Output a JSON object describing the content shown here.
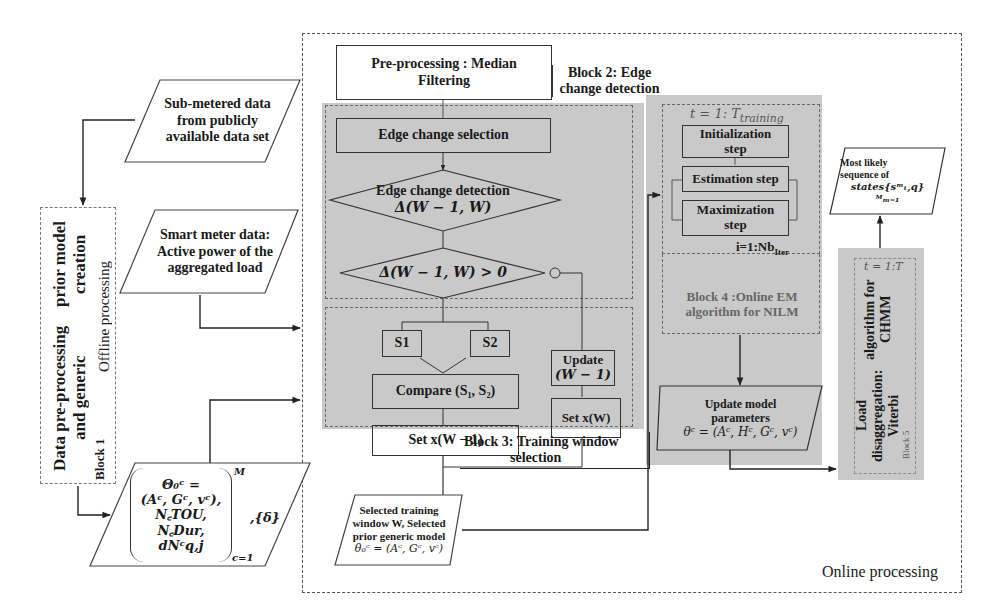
{
  "diagram": {
    "online_label": "Online processing",
    "offline_label": "Offline processing",
    "block1": {
      "title_line1": "Data pre-processing and generic",
      "title_line2": "prior model creation",
      "block_label": "Block 1"
    },
    "inputs": {
      "sub_metered": [
        "Sub-metered data",
        "from publicly",
        "available data set"
      ],
      "smart_meter": [
        "Smart meter data:",
        "Active power of the",
        "aggregated load"
      ]
    },
    "prior_model": {
      "lines": [
        "Θ₀ᶜ =",
        "(Aᶜ, Gᶜ, vᶜ),",
        "N꜀TOU, N꜀Dur,",
        "dNᶜq,j"
      ],
      "superscript": "M",
      "subscript": "c=1",
      "delta": ",{δ}"
    },
    "preprocessing": [
      "Pre-processing : Median",
      "Filtering"
    ],
    "block2": {
      "title": [
        "Block 2: Edge",
        "change detection"
      ],
      "edge_selection": "Edge change selection",
      "edge_detection": [
        "Edge change detection",
        "Δ(W − 1, W)"
      ],
      "condition": "Δ(W − 1, W) > 0"
    },
    "block3": {
      "title": [
        "Block 3: Training window",
        "selection"
      ],
      "s1": "S1",
      "s2": "S2",
      "compare": "Compare (S₁, S₂)",
      "set_prev": "Set x(W − 1)",
      "update": [
        "Update",
        "(W − 1)"
      ],
      "set_curr": "Set x(W)",
      "output": [
        "Selected training",
        "window W, Selected",
        "prior generic model",
        "θ₀ᶜ = (Aᶜ, Gᶜ, vᶜ)"
      ]
    },
    "block4": {
      "loop_label": "t = 1: T",
      "loop_sub": "training",
      "init": [
        "Initialization",
        "step"
      ],
      "estimation": "Estimation step",
      "maximization": [
        "Maximization",
        "step"
      ],
      "iter_label": "i=1:Nb",
      "iter_sub": "Iter",
      "title": [
        "Block 4 :Online EM",
        "algorithm for NILM"
      ],
      "update": [
        "Update model",
        "parameters",
        "θᶜ = (Aᶜ, Hᶜ, Gᶜ, vᶜ)"
      ]
    },
    "block5": {
      "loop_label": "t = 1:T",
      "title": [
        "Load disaggregation: Viterbi",
        "algorithm for CHMM"
      ],
      "block_label": "Block 5",
      "output": [
        "Most likely",
        "sequence of",
        "states{sᵐₜ,q}ᴹₘ₌₁"
      ]
    }
  }
}
